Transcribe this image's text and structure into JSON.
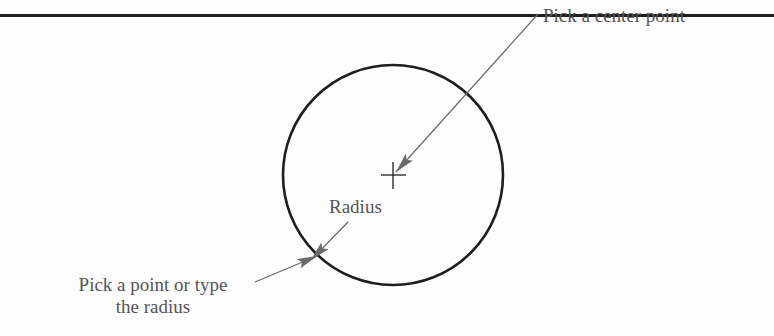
{
  "diagram": {
    "labels": {
      "center": "Pick a center point",
      "radius": "Radius",
      "pick_line1": "Pick a point or type",
      "pick_line2": "the radius"
    },
    "shapes": {
      "circle": {
        "cx": 393,
        "cy": 175,
        "r": 110
      },
      "center_mark": {
        "x": 393,
        "y": 175
      }
    },
    "colors": {
      "stroke": "#1e1e1e",
      "leader": "#6a6a6a",
      "text": "#555555",
      "background": "#fdfdfd"
    }
  }
}
